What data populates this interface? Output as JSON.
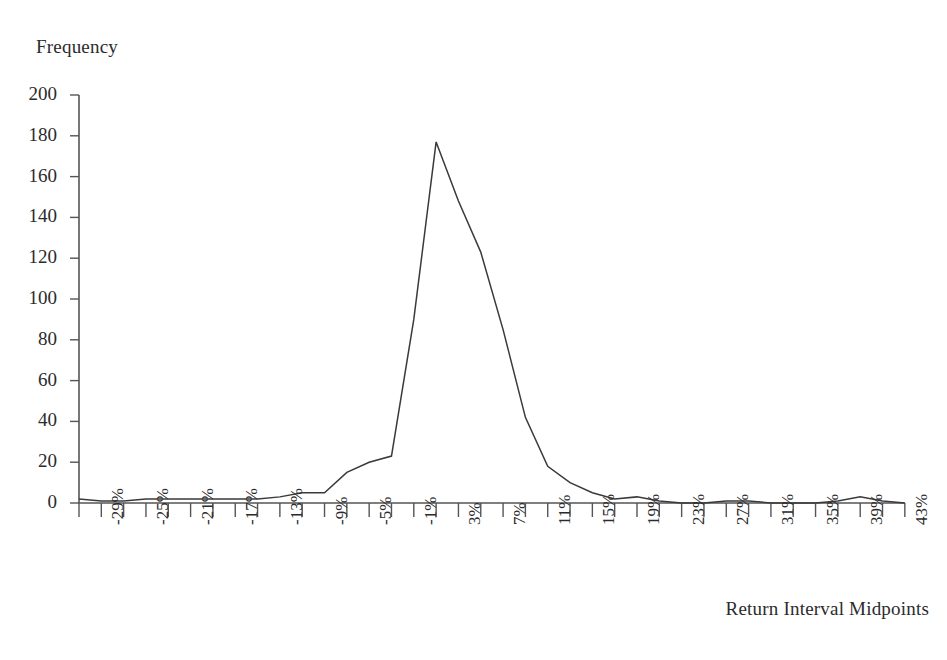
{
  "chart_data": {
    "type": "line",
    "title": "",
    "xlabel": "Return Interval Midpoints",
    "ylabel": "Frequency",
    "grid": false,
    "legend": "none",
    "ylim": [
      0,
      200
    ],
    "yticks": [
      0,
      20,
      40,
      60,
      80,
      100,
      120,
      140,
      160,
      180,
      200
    ],
    "ytick_labels": [
      "0",
      "20",
      "40",
      "60",
      "80",
      "100",
      "120",
      "140",
      "160",
      "180",
      "200"
    ],
    "xtick_labels": [
      "-29%",
      "-25%",
      "-21%",
      "-17%",
      "-13%",
      "-9%",
      "-5%",
      "-1%",
      "3%",
      "7%",
      "11%",
      "15%",
      "19%",
      "23%",
      "27%",
      "31%",
      "35%",
      "39%",
      "43%"
    ],
    "x_axis_note": "minor ticks every 2%, labels every 4%",
    "categories": [
      "-31%",
      "-29%",
      "-27%",
      "-25%",
      "-23%",
      "-21%",
      "-19%",
      "-17%",
      "-15%",
      "-13%",
      "-11%",
      "-9%",
      "-7%",
      "-5%",
      "-3%",
      "-1%",
      "1%",
      "3%",
      "5%",
      "7%",
      "9%",
      "11%",
      "13%",
      "15%",
      "17%",
      "19%",
      "21%",
      "23%",
      "25%",
      "27%",
      "29%",
      "31%",
      "33%",
      "35%",
      "37%",
      "39%",
      "41%",
      "43%"
    ],
    "values": [
      2,
      1,
      1,
      2,
      2,
      2,
      2,
      2,
      2,
      3,
      5,
      5,
      15,
      20,
      23,
      90,
      177,
      148,
      123,
      85,
      42,
      18,
      10,
      5,
      2,
      3,
      1,
      0,
      0,
      1,
      1,
      0,
      0,
      0,
      1,
      3,
      1,
      0
    ],
    "series": [
      {
        "name": "Frequency",
        "values": [
          2,
          1,
          1,
          2,
          2,
          2,
          2,
          2,
          2,
          3,
          5,
          5,
          15,
          20,
          23,
          90,
          177,
          148,
          123,
          85,
          42,
          18,
          10,
          5,
          2,
          3,
          1,
          0,
          0,
          1,
          1,
          0,
          0,
          0,
          1,
          3,
          1,
          0
        ]
      }
    ],
    "peak": {
      "x": "1%",
      "y": 177
    },
    "colors": {
      "line": "#3a3a3a",
      "axis": "#555555",
      "text": "#2b2b2b",
      "background": "#ffffff"
    }
  },
  "labels": {
    "y_axis_title": "Frequency",
    "x_axis_title": "Return Interval Midpoints"
  }
}
